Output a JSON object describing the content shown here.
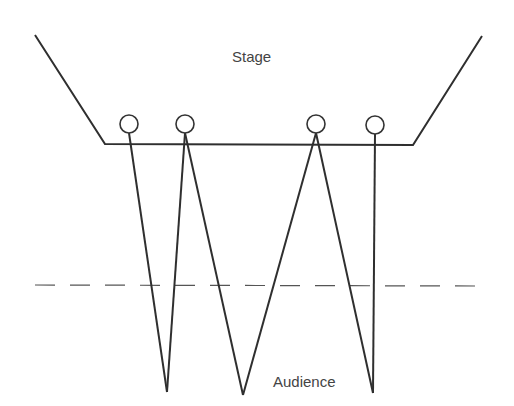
{
  "diagram": {
    "title": "",
    "labels": {
      "stage": "Stage",
      "audience": "Audience"
    },
    "colors": {
      "line": "#2f2f2f",
      "dashed": "#555555",
      "text": "#444444",
      "background": "#ffffff"
    },
    "stage_outline": {
      "points": [
        [
          35,
          35
        ],
        [
          105,
          144
        ],
        [
          413,
          145
        ],
        [
          482,
          36
        ]
      ]
    },
    "performers": [
      {
        "id": "performer-1",
        "cx": 129,
        "cy": 124,
        "r": 9
      },
      {
        "id": "performer-2",
        "cx": 185,
        "cy": 124,
        "r": 9
      },
      {
        "id": "performer-3",
        "cx": 316,
        "cy": 124,
        "r": 9
      },
      {
        "id": "performer-4",
        "cx": 375,
        "cy": 125,
        "r": 9
      }
    ],
    "sightlines": [
      {
        "from": [
          129,
          133
        ],
        "to": [
          167,
          392
        ]
      },
      {
        "from": [
          185,
          133
        ],
        "to": [
          167,
          392
        ]
      },
      {
        "from": [
          185,
          133
        ],
        "to": [
          243,
          395
        ]
      },
      {
        "from": [
          316,
          133
        ],
        "to": [
          243,
          395
        ]
      },
      {
        "from": [
          316,
          133
        ],
        "to": [
          373,
          393
        ]
      },
      {
        "from": [
          375,
          134
        ],
        "to": [
          373,
          393
        ]
      }
    ],
    "dashed_line": {
      "x1": 35,
      "y1": 285,
      "x2": 482,
      "y2": 286
    }
  }
}
